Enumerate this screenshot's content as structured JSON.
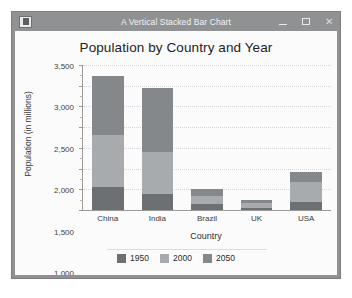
{
  "window": {
    "title": "A Vertical Stacked Bar Chart",
    "icon": "application-icon",
    "controls": {
      "minimize": "–",
      "maximize": "▢",
      "close": "✕"
    }
  },
  "chart_data": {
    "type": "bar",
    "stacked": true,
    "orientation": "vertical",
    "title": "Population by Country and Year",
    "xlabel": "Country",
    "ylabel": "Population (in millions)",
    "categories": [
      "China",
      "India",
      "Brazil",
      "UK",
      "USA"
    ],
    "series": [
      {
        "name": "1950",
        "color": "#6d7073",
        "values": [
          554,
          376,
          150,
          50,
          200
        ]
      },
      {
        "name": "2000",
        "color": "#a7abae",
        "values": [
          1266,
          1026,
          180,
          120,
          480
        ]
      },
      {
        "name": "2050",
        "color": "#84888b",
        "values": [
          1410,
          1538,
          180,
          70,
          250
        ]
      }
    ],
    "totals": [
      3230,
      2940,
      510,
      240,
      930
    ],
    "ylim": [
      0,
      3500
    ],
    "yticks": [
      0,
      500,
      1000,
      1500,
      2000,
      2500,
      3000,
      3500
    ],
    "ytick_labels": [
      "0",
      "500",
      "1,000",
      "1,500",
      "2,000",
      "2,500",
      "3,000",
      "3,500"
    ],
    "grid": true,
    "legend_position": "bottom",
    "legend": [
      "1950",
      "2000",
      "2050"
    ]
  },
  "colors": {
    "titlebar": "#8f9193",
    "plot_background": "#fbfbfb",
    "axis": "#9a9a9a",
    "gridline": "#d2d6da"
  }
}
